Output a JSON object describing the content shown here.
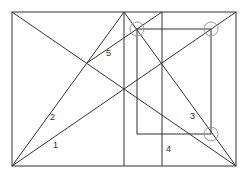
{
  "diagram": {
    "type": "geometric-composition",
    "stroke_color": "#333333",
    "circle_color": "#999999",
    "outer_rect": {
      "x1": 12,
      "y1": 12,
      "x2": 236,
      "y2": 166
    },
    "inner_rect": {
      "x1": 137,
      "y1": 29,
      "x2": 211,
      "y2": 134
    },
    "verticals": [
      {
        "x": 124,
        "y1": 12,
        "y2": 166
      },
      {
        "x": 162,
        "y1": 12,
        "y2": 166
      }
    ],
    "lines": [
      {
        "id": "main-diagonal",
        "x1": 12,
        "y1": 12,
        "x2": 236,
        "y2": 166
      },
      {
        "id": "line-1",
        "x1": 12,
        "y1": 166,
        "x2": 236,
        "y2": 12
      },
      {
        "id": "line-2",
        "x1": 12,
        "y1": 166,
        "x2": 124,
        "y2": 12
      },
      {
        "id": "line-3",
        "x1": 124,
        "y1": 12,
        "x2": 236,
        "y2": 166
      },
      {
        "id": "line-5",
        "x1": 87,
        "y1": 63,
        "x2": 162,
        "y2": 12
      }
    ],
    "circles": [
      {
        "cx": 137,
        "cy": 29,
        "r": 7
      },
      {
        "cx": 211,
        "cy": 29,
        "r": 7
      },
      {
        "cx": 211,
        "cy": 134,
        "r": 7
      }
    ],
    "labels": [
      {
        "text": "1",
        "x": 53,
        "y": 148
      },
      {
        "text": "2",
        "x": 50,
        "y": 120
      },
      {
        "text": "3",
        "x": 190,
        "y": 119
      },
      {
        "text": "4",
        "x": 166,
        "y": 152
      },
      {
        "text": "5",
        "x": 106,
        "y": 56
      }
    ]
  }
}
